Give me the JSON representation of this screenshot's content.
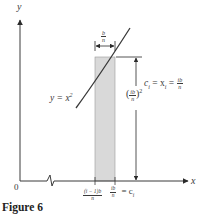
{
  "figure": {
    "caption": "Figure 6",
    "axes": {
      "x_label": "x",
      "y_label": "y",
      "origin_label": "0"
    },
    "curve_label": {
      "lhs": "y = x",
      "exponent": "2"
    },
    "width_label": {
      "numerator": "b",
      "denominator": "n"
    },
    "right_label": {
      "text": "c",
      "sub_i": "i",
      "eq1": " = x",
      "sub_i2": "i",
      "eq2": " = ",
      "numerator": "ib",
      "denominator": "n"
    },
    "height_label": {
      "open": "(",
      "numerator": "ib",
      "denominator": "n",
      "close": ")",
      "exponent": "2"
    },
    "tick_labels": {
      "left_numerator": "(i − 1)b",
      "left_denominator": "n",
      "right_numerator": "ib",
      "right_denominator": "n",
      "right_suffix": "= c",
      "right_suffix_sub": "i"
    },
    "colors": {
      "line": "#3a3a3a",
      "rect_fill": "#d9d9d9",
      "rect_stroke": "#8a8a8a"
    }
  }
}
